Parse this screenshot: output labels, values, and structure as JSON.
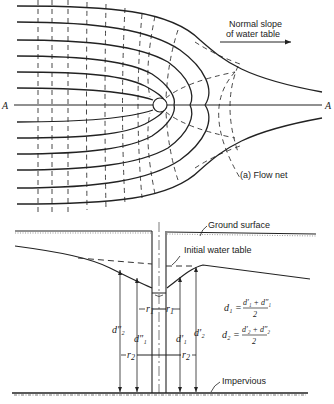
{
  "figure": {
    "panel_a": {
      "caption": "(a) Flow net",
      "axis_label_left": "A",
      "axis_label_right": "A",
      "slope_label_line1": "Normal slope",
      "slope_label_line2": "of water table"
    },
    "panel_b": {
      "ground_surface_label": "Ground surface",
      "initial_water_table_label": "Initial water table",
      "impervious_label": "Impervious",
      "r1_label": "r",
      "r1_sub": "1",
      "r2_label": "r",
      "r2_sub": "2",
      "d2pp_label": "d″₂",
      "d1pp_label": "d″₁",
      "d1p_label": "d′₁",
      "d2p_label": "d′₂",
      "eq1_lhs": "d₁ =",
      "eq1_num": "d′₁ + d″₁",
      "eq1_den": "2",
      "eq2_lhs": "d₂ =",
      "eq2_num": "d′₂ + d″₂",
      "eq2_den": "2"
    }
  }
}
